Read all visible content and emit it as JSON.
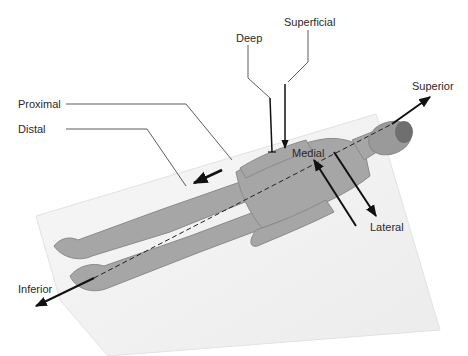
{
  "diagram": {
    "labels": {
      "deep": "Deep",
      "superficial": "Superficial",
      "superior": "Superior",
      "proximal": "Proximal",
      "distal": "Distal",
      "medial": "Medial",
      "lateral": "Lateral",
      "inferior": "Inferior"
    },
    "colors": {
      "background": "#ffffff",
      "platform": "#f2f2f2",
      "body": "#a9a9a9",
      "body_shadow": "#8f8f8f",
      "lines": "#1a1a1a",
      "text": "#2a2a2a"
    },
    "axes": [
      {
        "name": "superior-inferior",
        "style": "dashed axis with arrows at both ends"
      },
      {
        "name": "medial-lateral",
        "style": "two parallel arrows"
      },
      {
        "name": "proximal-distal",
        "style": "arrow along thigh"
      },
      {
        "name": "deep-superficial",
        "style": "two vertical arrows"
      }
    ]
  }
}
